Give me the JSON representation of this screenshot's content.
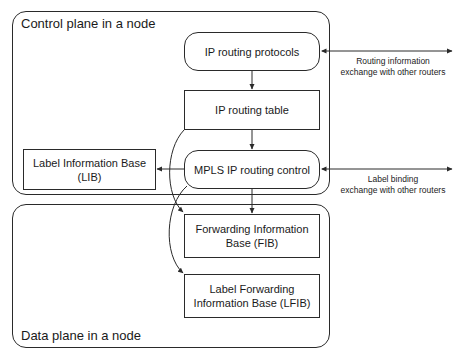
{
  "diagram": {
    "control_plane": {
      "label": "Control plane in a node",
      "boxes": {
        "ip_routing_protocols": "IP routing protocols",
        "ip_routing_table": "IP routing table",
        "mpls_ip_routing_control": "MPLS IP routing control",
        "lib_line1": "Label Information Base",
        "lib_line2": "(LIB)"
      }
    },
    "data_plane": {
      "label": "Data plane in a node",
      "boxes": {
        "fib_line1": "Forwarding Information",
        "fib_line2": "Base (FIB)",
        "lfib_line1": "Label Forwarding",
        "lfib_line2": "Information Base (LFIB)"
      }
    },
    "external": {
      "routing_info_line1": "Routing information",
      "routing_info_line2": "exchange with other routers",
      "label_binding_line1": "Label binding",
      "label_binding_line2": "exchange with other routers"
    },
    "colors": {
      "stroke": "#2a2a2a",
      "background": "#ffffff",
      "text": "#1a1a1a"
    }
  }
}
